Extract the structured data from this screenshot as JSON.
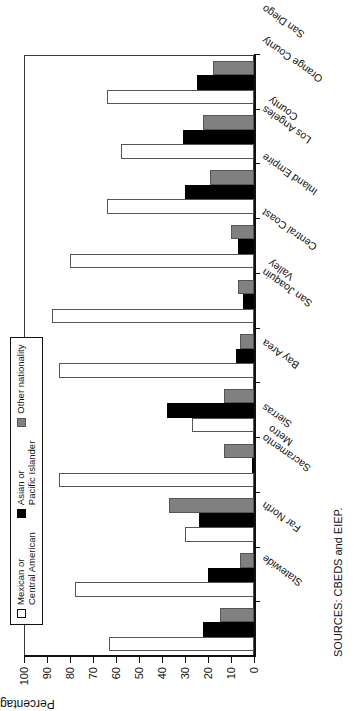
{
  "figure": {
    "source_note": "SOURCES: CBEDS and EIEP."
  },
  "legend": {
    "position": "top",
    "items": [
      {
        "label": "Mexican or\nCentral American",
        "color": "#ffffff",
        "swatch": "legend-swatch-white"
      },
      {
        "label": "Asian or\nPacific Islander",
        "color": "#000000",
        "swatch": "legend-swatch-black"
      },
      {
        "label": "Other nationality",
        "color": "#808080",
        "swatch": "legend-swatch-gray"
      }
    ]
  },
  "chart_data": {
    "type": "bar",
    "title": "",
    "xlabel": "",
    "ylabel": "Percentage",
    "ylim": [
      0,
      100
    ],
    "ytick_step": 10,
    "yticks": [
      0,
      10,
      20,
      30,
      40,
      50,
      60,
      70,
      80,
      90,
      100
    ],
    "ytick_labels": [
      "0",
      "10",
      "20",
      "30",
      "40",
      "50",
      "60",
      "70",
      "80",
      "90",
      "100"
    ],
    "grid": false,
    "orientation": "vertical-rotated-90ccw",
    "categories": [
      "Statewide",
      "Far North",
      "Sacramento\nMetro",
      "Sierras",
      "Bay Area",
      "San Joaquin\nValley",
      "Central Coast",
      "Inland Empire",
      "Los Angeles\nCounty",
      "Orange County",
      "San Diego"
    ],
    "series": [
      {
        "name": "Mexican or Central American",
        "color": "#ffffff",
        "values": [
          63,
          78,
          30,
          85,
          27,
          85,
          88,
          80,
          64,
          58,
          64
        ]
      },
      {
        "name": "Asian or Pacific Islander",
        "color": "#000000",
        "values": [
          22,
          20,
          24,
          0,
          38,
          8,
          5,
          7,
          30,
          31,
          25
        ]
      },
      {
        "name": "Other nationality",
        "color": "#808080",
        "values": [
          15,
          6,
          37,
          13,
          13,
          6,
          7,
          10,
          19,
          22,
          18
        ]
      }
    ]
  }
}
